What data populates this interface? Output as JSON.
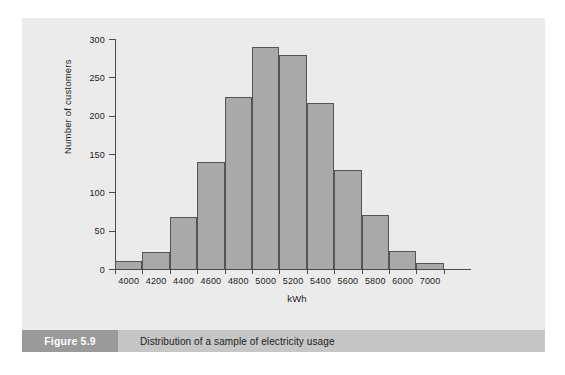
{
  "figure": {
    "number_label": "Figure 5.9",
    "caption": "Distribution of a sample of electricity usage"
  },
  "chart_data": {
    "type": "bar",
    "title": "Distribution of a sample of electricity usage",
    "xlabel": "kWh",
    "ylabel": "Number of customers",
    "categories": [
      "4000",
      "4200",
      "4400",
      "4600",
      "4800",
      "5000",
      "5200",
      "5400",
      "5600",
      "5800",
      "6000",
      "7000"
    ],
    "values": [
      10,
      22,
      68,
      140,
      224,
      290,
      279,
      216,
      129,
      70,
      23,
      8
    ],
    "ylim": [
      0,
      300
    ],
    "yticks": [
      "0",
      "50",
      "100",
      "150",
      "200",
      "250",
      "300"
    ],
    "ytick_values": [
      0,
      50,
      100,
      150,
      200,
      250,
      300
    ],
    "grid": false,
    "legend": "none",
    "bar_color": "#a9a9a9",
    "bar_edge_color": "#555555",
    "axis_color": "#4a4a4a",
    "panel_color": "#ebebeb"
  }
}
